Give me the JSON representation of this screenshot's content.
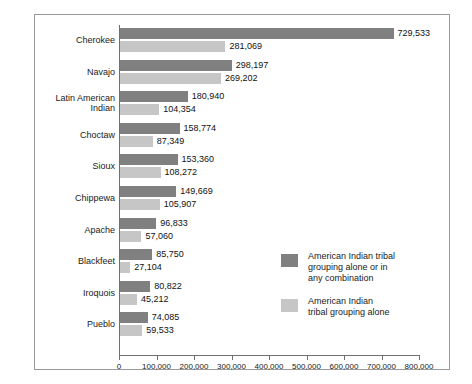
{
  "chart_data": {
    "type": "bar",
    "orientation": "horizontal",
    "title": "",
    "xlabel": "",
    "ylabel": "",
    "xlim": [
      0,
      800000
    ],
    "grid": false,
    "legend_position": "inner-bottom-right",
    "categories": [
      "Cherokee",
      "Navajo",
      "Latin American Indian",
      "Choctaw",
      "Sioux",
      "Chippewa",
      "Apache",
      "Blackfeet",
      "Iroquois",
      "Pueblo"
    ],
    "category_lines": [
      [
        "Cherokee"
      ],
      [
        "Navajo"
      ],
      [
        "Latin American",
        "Indian"
      ],
      [
        "Choctaw"
      ],
      [
        "Sioux"
      ],
      [
        "Chippewa"
      ],
      [
        "Apache"
      ],
      [
        "Blackfeet"
      ],
      [
        "Iroquois"
      ],
      [
        "Pueblo"
      ]
    ],
    "tick_values": [
      0,
      100000,
      200000,
      300000,
      400000,
      500000,
      600000,
      700000,
      800000
    ],
    "tick_labels": [
      "0",
      "100,000",
      "200,000",
      "300,000",
      "400,000",
      "500,000",
      "600,000",
      "700,000",
      "800,000"
    ],
    "series": [
      {
        "name": "American Indian tribal grouping alone or in any combination",
        "color": "#808080",
        "values": [
          729533,
          298197,
          180940,
          158774,
          153360,
          149669,
          96833,
          85750,
          80822,
          74085
        ],
        "labels": [
          "729,533",
          "298,197",
          "180,940",
          "158,774",
          "153,360",
          "149,669",
          "96,833",
          "85,750",
          "80,822",
          "74,085"
        ]
      },
      {
        "name": "American Indian tribal grouping alone",
        "color": "#c6c6c6",
        "values": [
          281069,
          269202,
          104354,
          87349,
          108272,
          105907,
          57060,
          27104,
          45212,
          59533
        ],
        "labels": [
          "281,069",
          "269,202",
          "104,354",
          "87,349",
          "108,272",
          "105,907",
          "57,060",
          "27,104",
          "45,212",
          "59,533"
        ]
      }
    ]
  },
  "legend": {
    "entries": [
      {
        "swatch_color": "#808080",
        "lines": [
          "American Indian tribal",
          "grouping alone or in",
          "any combination"
        ]
      },
      {
        "swatch_color": "#c6c6c6",
        "lines": [
          "American Indian",
          "tribal grouping alone"
        ]
      }
    ]
  }
}
